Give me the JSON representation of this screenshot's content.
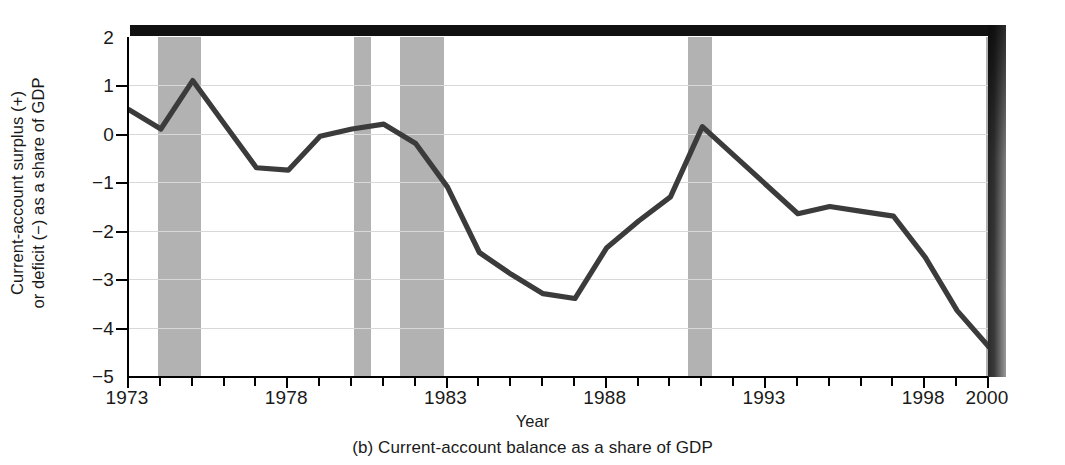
{
  "figure": {
    "caption": "(b) Current-account balance as a share of GDP",
    "xlabel": "Year",
    "ylabel_line1": "Current-account surplus (+)",
    "ylabel_line2": "or deficit (−) as a share of GDP"
  },
  "colors": {
    "series_line": "#3b3b3b",
    "recession_band": "#b2b2b2",
    "gridline": "#d8d8d8",
    "axis": "#000000",
    "top_bar": "#111111",
    "background": "#ffffff"
  },
  "chart_data": {
    "type": "line",
    "title": "(b) Current-account balance as a share of GDP",
    "xlabel": "Year",
    "ylabel": "Current-account surplus (+) or deficit (−) as a share of GDP",
    "xlim": [
      1973,
      2000
    ],
    "ylim": [
      -5,
      2
    ],
    "grid": true,
    "legend": "none",
    "ytick_labels": [
      "2",
      "1",
      "0",
      "−1",
      "−2",
      "−3",
      "−4",
      "−5"
    ],
    "ytick_values": [
      2,
      1,
      0,
      -1,
      -2,
      -3,
      -4,
      -5
    ],
    "xtick_labels": [
      "1973",
      "1978",
      "1983",
      "1988",
      "1993",
      "1998",
      "2000"
    ],
    "xtick_values": [
      1973,
      1978,
      1983,
      1988,
      1993,
      1998,
      2000
    ],
    "x_minor_tick_step": 1,
    "series": [
      {
        "name": "Current-account balance as a share of GDP",
        "x": [
          1973,
          1974,
          1975,
          1976,
          1977,
          1978,
          1979,
          1980,
          1981,
          1982,
          1983,
          1984,
          1985,
          1986,
          1987,
          1988,
          1989,
          1990,
          1991,
          1992,
          1993,
          1994,
          1995,
          1996,
          1997,
          1998,
          1999,
          2000
        ],
        "values": [
          0.5,
          0.1,
          1.1,
          0.2,
          -0.7,
          -0.75,
          -0.05,
          0.1,
          0.2,
          -0.2,
          -1.1,
          -2.45,
          -2.9,
          -3.3,
          -3.4,
          -2.35,
          -1.8,
          -1.3,
          0.15,
          -0.45,
          -1.05,
          -1.65,
          -1.5,
          -1.6,
          -1.7,
          -2.55,
          -3.65,
          -4.4
        ]
      }
    ],
    "recession_bands": [
      {
        "label": "1973-75 recession",
        "start": 1973.9,
        "end": 1975.25
      },
      {
        "label": "1980 recession",
        "start": 1980.05,
        "end": 1980.6
      },
      {
        "label": "1981-82 recession",
        "start": 1981.5,
        "end": 1982.9
      },
      {
        "label": "1990-91 recession",
        "start": 1990.55,
        "end": 1991.3
      },
      {
        "label": "2001 recession edge",
        "start": 1999.9,
        "end": 2000.1
      }
    ]
  }
}
